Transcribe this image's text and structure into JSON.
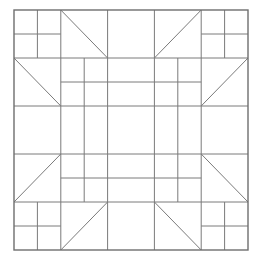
{
  "diagram": {
    "type": "geometric-line-drawing",
    "grid_divisions": 10,
    "line_color": "#7a7a7a",
    "background_color": "#ffffff",
    "outer_border": {
      "from": [
        0,
        0
      ],
      "to": [
        10,
        10
      ]
    },
    "segments": [
      {
        "name": "h-line-y2",
        "from": [
          0,
          2
        ],
        "to": [
          10,
          2
        ]
      },
      {
        "name": "h-line-y4",
        "from": [
          0,
          4
        ],
        "to": [
          10,
          4
        ]
      },
      {
        "name": "h-line-y6",
        "from": [
          0,
          6
        ],
        "to": [
          10,
          6
        ]
      },
      {
        "name": "h-line-y8",
        "from": [
          0,
          8
        ],
        "to": [
          10,
          8
        ]
      },
      {
        "name": "v-line-x2",
        "from": [
          2,
          0
        ],
        "to": [
          2,
          10
        ]
      },
      {
        "name": "v-line-x4",
        "from": [
          4,
          0
        ],
        "to": [
          4,
          10
        ]
      },
      {
        "name": "v-line-x6",
        "from": [
          6,
          0
        ],
        "to": [
          6,
          10
        ]
      },
      {
        "name": "v-line-x8",
        "from": [
          8,
          0
        ],
        "to": [
          8,
          10
        ]
      },
      {
        "name": "corner-tl-v",
        "from": [
          1,
          0
        ],
        "to": [
          1,
          2
        ]
      },
      {
        "name": "corner-tl-h",
        "from": [
          0,
          1
        ],
        "to": [
          2,
          1
        ]
      },
      {
        "name": "corner-tr-v",
        "from": [
          9,
          0
        ],
        "to": [
          9,
          2
        ]
      },
      {
        "name": "corner-tr-h",
        "from": [
          8,
          1
        ],
        "to": [
          10,
          1
        ]
      },
      {
        "name": "corner-bl-v",
        "from": [
          1,
          8
        ],
        "to": [
          1,
          10
        ]
      },
      {
        "name": "corner-bl-h",
        "from": [
          0,
          9
        ],
        "to": [
          2,
          9
        ]
      },
      {
        "name": "corner-br-v",
        "from": [
          9,
          8
        ],
        "to": [
          9,
          10
        ]
      },
      {
        "name": "corner-br-h",
        "from": [
          8,
          9
        ],
        "to": [
          10,
          9
        ]
      },
      {
        "name": "inner-band-top",
        "from": [
          2,
          3
        ],
        "to": [
          8,
          3
        ]
      },
      {
        "name": "inner-band-bottom",
        "from": [
          2,
          7
        ],
        "to": [
          8,
          7
        ]
      },
      {
        "name": "inner-band-left",
        "from": [
          3,
          2
        ],
        "to": [
          3,
          8
        ]
      },
      {
        "name": "inner-band-right",
        "from": [
          7,
          2
        ],
        "to": [
          7,
          8
        ]
      },
      {
        "name": "diag-top-left",
        "from": [
          2,
          0
        ],
        "to": [
          4,
          2
        ]
      },
      {
        "name": "diag-top-right",
        "from": [
          8,
          0
        ],
        "to": [
          6,
          2
        ]
      },
      {
        "name": "diag-left-top",
        "from": [
          0,
          2
        ],
        "to": [
          2,
          4
        ]
      },
      {
        "name": "diag-left-bottom",
        "from": [
          0,
          8
        ],
        "to": [
          2,
          6
        ]
      },
      {
        "name": "diag-right-top",
        "from": [
          10,
          2
        ],
        "to": [
          8,
          4
        ]
      },
      {
        "name": "diag-right-bottom",
        "from": [
          8,
          6
        ],
        "to": [
          10,
          8
        ]
      },
      {
        "name": "diag-bottom-left",
        "from": [
          2,
          10
        ],
        "to": [
          4,
          8
        ]
      },
      {
        "name": "diag-bottom-right",
        "from": [
          6,
          8
        ],
        "to": [
          8,
          10
        ]
      }
    ]
  }
}
